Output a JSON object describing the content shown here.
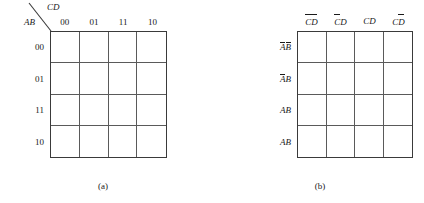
{
  "figures": [
    {
      "id": "a",
      "caption": "(a)",
      "corner": {
        "top_right_label": "CD",
        "bottom_left_label": "AB",
        "divider": "diagonal-line"
      },
      "column_headers": [
        "00",
        "01",
        "11",
        "10"
      ],
      "row_labels": [
        "00",
        "01",
        "11",
        "10"
      ],
      "grid": {
        "rows": 4,
        "columns": 4
      },
      "cells": [
        [
          "",
          "",
          "",
          ""
        ],
        [
          "",
          "",
          "",
          ""
        ],
        [
          "",
          "",
          "",
          ""
        ],
        [
          "",
          "",
          "",
          ""
        ]
      ]
    },
    {
      "id": "b",
      "caption": "(b)",
      "column_headers": [
        {
          "first": "C",
          "first_bar": true,
          "second": "D",
          "second_bar": true
        },
        {
          "first": "C",
          "first_bar": true,
          "second": "D",
          "second_bar": false
        },
        {
          "first": "C",
          "first_bar": false,
          "second": "D",
          "second_bar": false
        },
        {
          "first": "C",
          "first_bar": false,
          "second": "D",
          "second_bar": true
        }
      ],
      "row_labels": [
        {
          "first": "A",
          "first_bar": true,
          "second": "B",
          "second_bar": true
        },
        {
          "first": "A",
          "first_bar": true,
          "second": "B",
          "second_bar": false
        },
        {
          "first": "A",
          "first_bar": false,
          "second": "B",
          "second_bar": false
        },
        {
          "first": "A",
          "first_bar": false,
          "second": "B",
          "second_bar": false
        }
      ],
      "grid": {
        "rows": 4,
        "columns": 4
      },
      "cells": [
        [
          "",
          "",
          "",
          ""
        ],
        [
          "",
          "",
          "",
          ""
        ],
        [
          "",
          "",
          "",
          ""
        ],
        [
          "",
          "",
          "",
          ""
        ]
      ]
    }
  ],
  "style": {
    "background": "#ffffff",
    "ink": "#1a1a1a",
    "grid_line": "#5a5a5a",
    "grid_border": "#3a3a3a"
  }
}
